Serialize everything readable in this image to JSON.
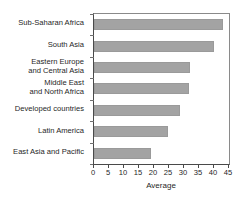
{
  "chart_data": {
    "type": "bar",
    "orientation": "horizontal",
    "title": "",
    "xlabel": "Average",
    "ylabel": "",
    "categories": [
      "Sub-Saharan Africa",
      "South Asia",
      "Eastern Europe\nand Central Asia",
      "Middle East\nand North Africa",
      "Developed countries",
      "Latin America",
      "East Asia and Pacific"
    ],
    "values": [
      43,
      40,
      32,
      31.5,
      28.5,
      24.5,
      19
    ],
    "xlim": [
      0,
      45
    ],
    "xticks": [
      0,
      5,
      10,
      15,
      20,
      25,
      30,
      35,
      40,
      45
    ],
    "xtick_labels": [
      "0",
      "5",
      "10",
      "15",
      "20",
      "25",
      "30",
      "35",
      "40",
      "45"
    ],
    "grid": false,
    "legend": null,
    "bar_color": "#a3a3a3",
    "axis_color": "#4a4a4a"
  }
}
